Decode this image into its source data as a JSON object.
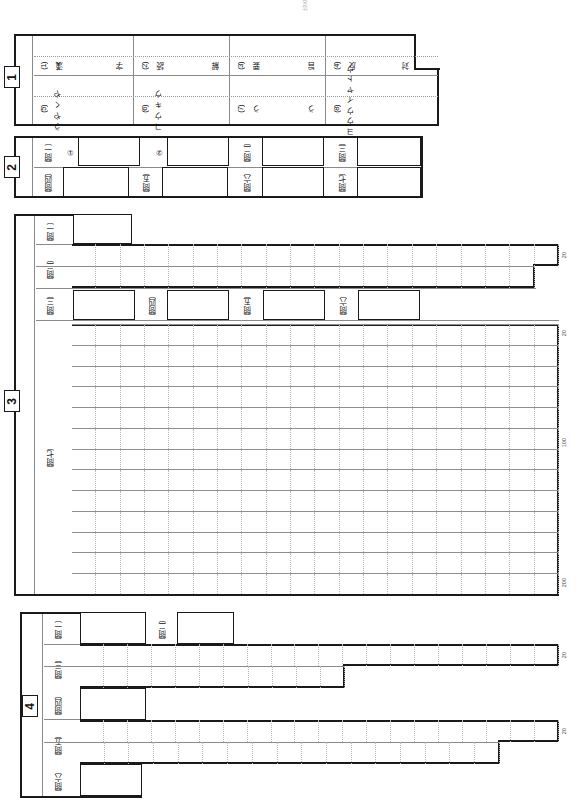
{
  "document": {
    "kind": "japanese-exam-answer-sheet",
    "orientation": "text printed sideways (sheet rotated 90 degrees)",
    "top_header_fragment": "国語　解答用紙　受検番号　　　　　氏名"
  },
  "sections": [
    {
      "number": "1",
      "rows": [
        {
          "items": [
            {
              "no": "(1)",
              "lead": "漢",
              "trail": "字"
            },
            {
              "no": "(2)",
              "lead": "読",
              "trail": "解"
            },
            {
              "no": "(3)",
              "lead": "要",
              "trail": "旨"
            },
            {
              "no": "(4)",
              "lead": "反",
              "trail": "対"
            }
          ]
        },
        {
          "items": [
            {
              "no": "(5)",
              "kana": "うやくや"
            },
            {
              "no": "(6)",
              "kana": "コウキウ"
            },
            {
              "no": "(7)",
              "lead": "う",
              "trail": "う"
            },
            {
              "no": "(8)",
              "kana": "イキヨウウイヤトウ"
            }
          ]
        }
      ]
    },
    {
      "number": "2",
      "rows": [
        {
          "cells": [
            {
              "label": "〔問一〕",
              "sub": "①"
            },
            {
              "label": "",
              "sub": "②"
            },
            {
              "label": "〔問二〕"
            },
            {
              "label": "〔問三〕"
            }
          ]
        },
        {
          "cells": [
            {
              "label": "〔問四〕"
            },
            {
              "label": "〔問五〕"
            },
            {
              "label": "〔問六〕"
            },
            {
              "label": "〔問七〕"
            }
          ]
        }
      ]
    },
    {
      "number": "3",
      "questions": [
        {
          "label": "〔問一〕",
          "type": "box"
        },
        {
          "label": "〔問二〕",
          "type": "grid",
          "columns": 20,
          "rows": 2,
          "limit_marker": "20"
        },
        {
          "label": "〔問三〕",
          "type": "box"
        },
        {
          "label": "〔問四〕",
          "type": "box"
        },
        {
          "label": "〔問五〕",
          "type": "box"
        },
        {
          "label": "〔問六〕",
          "type": "box"
        },
        {
          "label": "〔問七〕",
          "type": "grid",
          "columns": 20,
          "rows": 13,
          "markers": [
            "20",
            "100",
            "200"
          ]
        }
      ]
    },
    {
      "number": "4",
      "questions": [
        {
          "label": "〔問一〕",
          "type": "box"
        },
        {
          "label": "〔問二〕",
          "type": "box"
        },
        {
          "label": "〔問三〕",
          "type": "grid",
          "columns": 20,
          "rows": 2,
          "limit_marker": "20"
        },
        {
          "label": "〔問四〕",
          "type": "box"
        },
        {
          "label": "〔問五〕",
          "type": "grid",
          "columns": 20,
          "rows": 2,
          "limit_marker": "20"
        },
        {
          "label": "〔問六〕",
          "type": "box"
        }
      ]
    }
  ],
  "markers": {
    "twenty": "20",
    "hundred": "100",
    "twohundred": "200"
  }
}
